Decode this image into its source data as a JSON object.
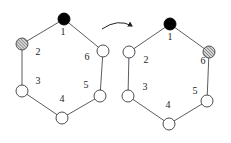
{
  "diagram": {
    "colors": {
      "edge": "#4a4a4a",
      "node_black": "#000000",
      "node_white": "#ffffff",
      "node_hatched": "#888888"
    },
    "arrow": {
      "from": "left-hexagon",
      "to": "right-hexagon",
      "direction": "left-to-right"
    },
    "left": {
      "nodes": [
        {
          "id": "1",
          "label": "1",
          "fill": "black",
          "cx": 64,
          "cy": 19,
          "lx": 63,
          "ly": 33
        },
        {
          "id": "2",
          "label": "2",
          "fill": "hatched",
          "cx": 22,
          "cy": 44,
          "lx": 38,
          "ly": 53
        },
        {
          "id": "3",
          "label": "3",
          "fill": "white",
          "cx": 22,
          "cy": 91,
          "lx": 38,
          "ly": 82
        },
        {
          "id": "4",
          "label": "4",
          "fill": "white",
          "cx": 62,
          "cy": 118,
          "lx": 62,
          "ly": 100
        },
        {
          "id": "5",
          "label": "5",
          "fill": "white",
          "cx": 100,
          "cy": 96,
          "lx": 86,
          "ly": 86
        },
        {
          "id": "6",
          "label": "6",
          "fill": "white",
          "cx": 103,
          "cy": 51,
          "lx": 87,
          "ly": 58
        }
      ]
    },
    "right": {
      "nodes": [
        {
          "id": "1",
          "label": "1",
          "fill": "black",
          "cx": 170,
          "cy": 24,
          "lx": 170,
          "ly": 38
        },
        {
          "id": "2",
          "label": "2",
          "fill": "white",
          "cx": 129,
          "cy": 52,
          "lx": 146,
          "ly": 61
        },
        {
          "id": "3",
          "label": "3",
          "fill": "white",
          "cx": 128,
          "cy": 96,
          "lx": 145,
          "ly": 88
        },
        {
          "id": "4",
          "label": "4",
          "fill": "white",
          "cx": 169,
          "cy": 124,
          "lx": 168,
          "ly": 106
        },
        {
          "id": "5",
          "label": "5",
          "fill": "white",
          "cx": 207,
          "cy": 101,
          "lx": 195,
          "ly": 92
        },
        {
          "id": "6",
          "label": "6",
          "fill": "hatched",
          "cx": 209,
          "cy": 52,
          "lx": 203,
          "ly": 62
        }
      ]
    }
  }
}
